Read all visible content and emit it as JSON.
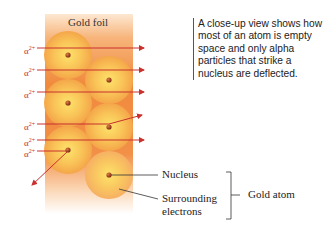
{
  "diagram": {
    "foil_label": "Gold foil",
    "caption": "A close-up view shows how most of an atom is empty space and only alpha particles that strike a nucleus are deflected.",
    "particle_symbol": "α",
    "particle_charge": "2+",
    "labels": {
      "nucleus": "Nucleus",
      "electrons_line1": "Surrounding",
      "electrons_line2": "electrons",
      "atom": "Gold atom"
    },
    "colors": {
      "foil": "#f2883a",
      "atom_center": "#fbd65a",
      "atom_edge": "#f4a545",
      "nucleus": "#9b3d1a",
      "arrow": "#c8312e"
    },
    "alpha_rows": [
      {
        "y": 48,
        "path": "straight"
      },
      {
        "y": 70,
        "path": "straight"
      },
      {
        "y": 92,
        "path": "straight"
      },
      {
        "y": 124,
        "path": "deflected-up"
      },
      {
        "y": 140,
        "path": "straight"
      },
      {
        "y": 150,
        "path": "deflected-down"
      }
    ]
  }
}
